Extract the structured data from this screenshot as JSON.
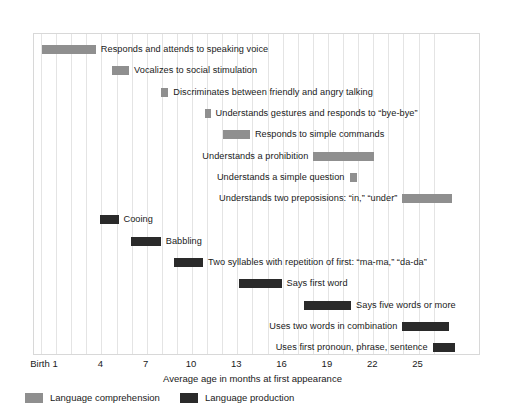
{
  "chart_data": {
    "type": "bar",
    "orientation": "horizontal-range",
    "title": "",
    "xlabel": "Average age in months at first appearance",
    "ylabel": "",
    "xlim": [
      0,
      26.5
    ],
    "grid": true,
    "legend_position": "bottom-left",
    "tick_labels": [
      "Birth",
      "1",
      "4",
      "7",
      "10",
      "13",
      "16",
      "19",
      "22",
      "25"
    ],
    "tick_values": [
      0,
      1,
      4,
      7,
      10,
      13,
      16,
      19,
      22,
      25
    ],
    "gridline_values": [
      0,
      1,
      2,
      3,
      4,
      5,
      6,
      7,
      8,
      9,
      10,
      11,
      12,
      13,
      14,
      15,
      16,
      17,
      18,
      19,
      20,
      21,
      22,
      23,
      24,
      25,
      26
    ],
    "series": [
      {
        "name": "Language comprehension",
        "color": "#8f8f8f"
      },
      {
        "name": "Language production",
        "color": "#2a2a2a"
      }
    ],
    "legend": [
      {
        "label": "Language comprehension",
        "color": "#8f8f8f"
      },
      {
        "label": "Language production",
        "color": "#2a2a2a"
      }
    ],
    "bars": [
      {
        "label": "Responds and attends to speaking voice",
        "series": "Language comprehension",
        "start": 0.1,
        "end": 3.7,
        "label_side": "right"
      },
      {
        "label": "Vocalizes to social stimulation",
        "series": "Language comprehension",
        "start": 4.8,
        "end": 5.9,
        "label_side": "right"
      },
      {
        "label": "Discriminates between friendly and angry talking",
        "series": "Language comprehension",
        "start": 8.0,
        "end": 8.5,
        "label_side": "right"
      },
      {
        "label": "Understands gestures and responds to “bye-bye”",
        "series": "Language comprehension",
        "start": 10.9,
        "end": 11.3,
        "label_side": "right"
      },
      {
        "label": "Responds to simple commands",
        "series": "Language comprehension",
        "start": 12.1,
        "end": 13.9,
        "label_side": "right"
      },
      {
        "label": "Understands a prohibition",
        "series": "Language comprehension",
        "start": 18.1,
        "end": 22.1,
        "label_side": "left"
      },
      {
        "label": "Understands a simple question",
        "series": "Language comprehension",
        "start": 20.5,
        "end": 21.0,
        "label_side": "left"
      },
      {
        "label": "Understands two preposisions: “in,” “under”",
        "series": "Language comprehension",
        "start": 24.0,
        "end": 27.3,
        "label_side": "left"
      },
      {
        "label": "Cooing",
        "series": "Language production",
        "start": 4.0,
        "end": 5.2,
        "label_side": "right"
      },
      {
        "label": "Babbling",
        "series": "Language production",
        "start": 6.0,
        "end": 8.0,
        "label_side": "right"
      },
      {
        "label": "Two syllables with repetition of first: “ma-ma,” “da-da”",
        "series": "Language production",
        "start": 8.9,
        "end": 10.8,
        "label_side": "right"
      },
      {
        "label": "Says first word",
        "series": "Language production",
        "start": 13.2,
        "end": 16.0,
        "label_side": "right"
      },
      {
        "label": "Says five words or more",
        "series": "Language production",
        "start": 17.5,
        "end": 20.6,
        "label_side": "right"
      },
      {
        "label": "Uses two words in combination",
        "series": "Language production",
        "start": 24.0,
        "end": 27.1,
        "label_side": "left"
      },
      {
        "label": "Uses first pronoun, phrase, sentence",
        "series": "Language production",
        "start": 26.0,
        "end": 27.5,
        "label_side": "left"
      }
    ]
  }
}
